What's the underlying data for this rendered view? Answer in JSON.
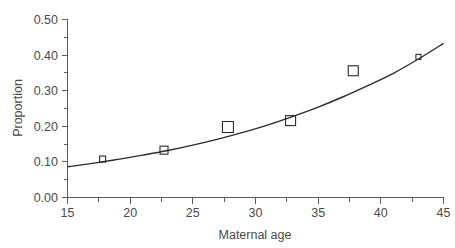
{
  "chart_data": {
    "type": "scatter",
    "title": "",
    "subtitle": "",
    "xlabel": "Maternal age",
    "ylabel": "Proportion",
    "xlim": [
      15,
      45
    ],
    "ylim": [
      0.0,
      0.5
    ],
    "grid": false,
    "legend": "none",
    "x_ticks": [
      15,
      20,
      25,
      30,
      35,
      40,
      45
    ],
    "x_tick_labels": [
      "15",
      "20",
      "25",
      "30",
      "35",
      "40",
      "45"
    ],
    "x_minor_ticks": [
      17.5,
      22.5,
      27.5,
      32.5,
      37.5,
      42.5
    ],
    "y_ticks": [
      0.0,
      0.1,
      0.2,
      0.3,
      0.4,
      0.5
    ],
    "y_tick_labels": [
      "0.00",
      "0.10",
      "0.20",
      "0.30",
      "0.40",
      "0.50"
    ],
    "y_minor_ticks": [
      0.05,
      0.15,
      0.25,
      0.35,
      0.45
    ],
    "series": [
      {
        "name": "observed proportions",
        "marker": "open-square",
        "x": [
          17.8,
          22.7,
          27.8,
          32.8,
          37.8,
          43.0
        ],
        "y": [
          0.108,
          0.133,
          0.198,
          0.216,
          0.356,
          0.395
        ],
        "marker_sizes": [
          6,
          8,
          11,
          10,
          10,
          5
        ]
      },
      {
        "name": "fitted curve",
        "type": "line",
        "x": [
          15,
          17,
          19,
          21,
          23,
          25,
          27,
          29,
          31,
          33,
          35,
          37,
          39,
          41,
          43,
          45
        ],
        "y": [
          0.086,
          0.096,
          0.107,
          0.119,
          0.132,
          0.147,
          0.164,
          0.183,
          0.204,
          0.228,
          0.254,
          0.283,
          0.315,
          0.349,
          0.389,
          0.433
        ]
      }
    ]
  },
  "axes": {
    "y_title": "Proportion",
    "x_title": "Maternal age"
  }
}
